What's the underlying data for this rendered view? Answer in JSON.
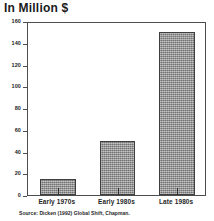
{
  "chart_data": {
    "type": "bar",
    "title": "In Million $",
    "xlabel": "",
    "ylabel": "",
    "categories": [
      "Early 1970s",
      "Early 1980s",
      "Late 1980s"
    ],
    "values": [
      15,
      50,
      150
    ],
    "ylim": [
      0,
      160
    ],
    "yticks": [
      0,
      20,
      40,
      60,
      80,
      100,
      120,
      140,
      160
    ],
    "ytick_labels": [
      "0",
      "20",
      "40",
      "60",
      "80",
      "100",
      "120",
      "140",
      "160"
    ],
    "grid": false,
    "legend": null,
    "bar_color": "#8c8c8c",
    "bar_edge_color": "#3f3f3f",
    "frame_color": "#4d4d4d",
    "source": "Source: Dicken (1992) Global Shift, Chapman."
  }
}
